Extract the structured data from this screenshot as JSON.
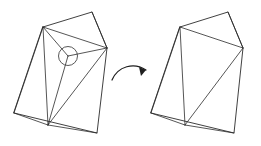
{
  "figure": {
    "background_color": "#ffffff",
    "line_color": "#2b2b2b",
    "arrow_color": "#1f1f1f",
    "highlight_color": "#3a3a3a",
    "width": 261,
    "height": 146,
    "panels": [
      {
        "id": "before",
        "name": "left-mesh-before",
        "label": "",
        "outline": "43,27 92,12 107,48 97,133 14,113",
        "edges": [
          "43,27 107,48",
          "43,27 48,125",
          "43,27 68,56",
          "68,56 107,48",
          "68,56 48,125",
          "43,27 14,113",
          "48,125 107,48",
          "48,125 14,113",
          "48,125 97,133",
          "92,12 107,48"
        ],
        "highlight": {
          "cx": 68,
          "cy": 56,
          "r": 9.5,
          "name": "removed-vertex"
        },
        "vertex_count": 7,
        "triangle_count": 7
      },
      {
        "id": "after",
        "name": "right-mesh-after",
        "label": "",
        "outline": "180,27 228,12 243,48 234,133 151,113",
        "edges": [
          "180,27 243,48",
          "180,27 185,125",
          "180,27 151,113",
          "185,125 243,48",
          "185,125 151,113",
          "185,125 234,133",
          "228,12 243,48"
        ],
        "vertex_count": 6,
        "triangle_count": 5
      }
    ],
    "arrow": {
      "name": "transform-arrow",
      "path": "M 112,80 C 118,66 134,62 146,70",
      "head": "146,70 139,67 141,76",
      "direction": "left-to-right"
    }
  }
}
